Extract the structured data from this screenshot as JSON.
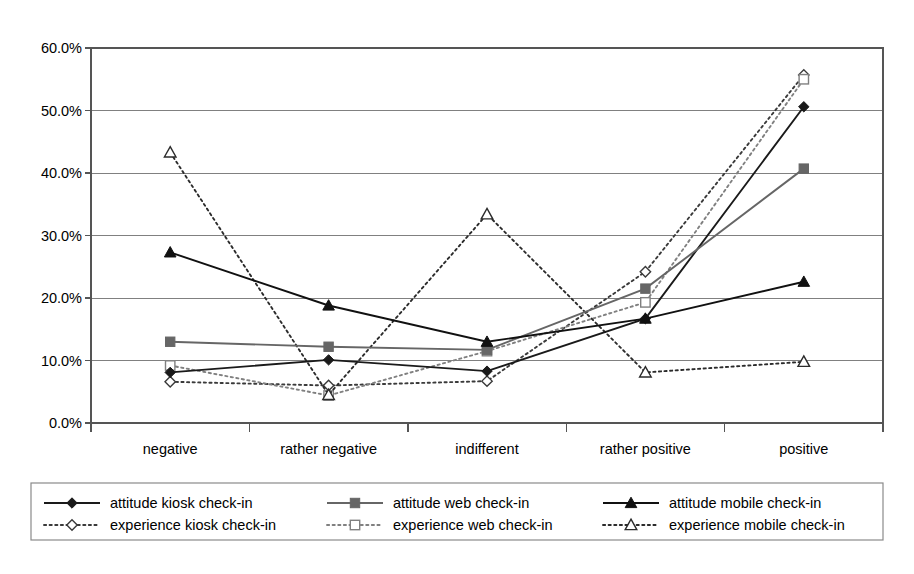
{
  "chart_data": {
    "type": "line",
    "title": "",
    "xlabel": "",
    "ylabel": "",
    "categories": [
      "negative",
      "rather negative",
      "indifferent",
      "rather positive",
      "positive"
    ],
    "ylim": [
      0,
      60
    ],
    "y_ticks": [
      "0.0%",
      "10.0%",
      "20.0%",
      "30.0%",
      "40.0%",
      "50.0%",
      "60.0%"
    ],
    "y_tick_values": [
      0,
      10,
      20,
      30,
      40,
      50,
      60
    ],
    "grid": "horizontal",
    "legend_position": "bottom",
    "series": [
      {
        "name": "attitude kiosk check-in",
        "values": [
          8.1,
          10.1,
          8.3,
          16.7,
          50.6
        ],
        "style": "solid",
        "marker": "diamond-filled",
        "color": "#1a1a1a"
      },
      {
        "name": "attitude web check-in",
        "values": [
          13.0,
          12.2,
          11.7,
          21.5,
          40.7
        ],
        "style": "solid",
        "marker": "square-filled",
        "color": "#666666"
      },
      {
        "name": "attitude mobile check-in",
        "values": [
          27.3,
          18.8,
          13.0,
          16.7,
          22.6
        ],
        "style": "solid",
        "marker": "triangle-filled",
        "color": "#111111"
      },
      {
        "name": "experience kiosk check-in",
        "values": [
          6.6,
          6.0,
          6.7,
          24.2,
          55.7
        ],
        "style": "dotted",
        "marker": "diamond-open",
        "color": "#3a3a3a"
      },
      {
        "name": "experience web check-in",
        "values": [
          9.2,
          4.4,
          11.5,
          19.3,
          55.0
        ],
        "style": "dotted",
        "marker": "square-open",
        "color": "#808080"
      },
      {
        "name": "experience mobile check-in",
        "values": [
          43.3,
          4.5,
          33.4,
          8.1,
          9.8
        ],
        "style": "dotted",
        "marker": "triangle-open",
        "color": "#2b2b2b"
      }
    ]
  },
  "legend": {
    "entries": [
      "attitude kiosk check-in",
      "attitude web check-in",
      "attitude mobile check-in",
      "experience kiosk check-in",
      "experience web check-in",
      "experience mobile check-in"
    ]
  }
}
